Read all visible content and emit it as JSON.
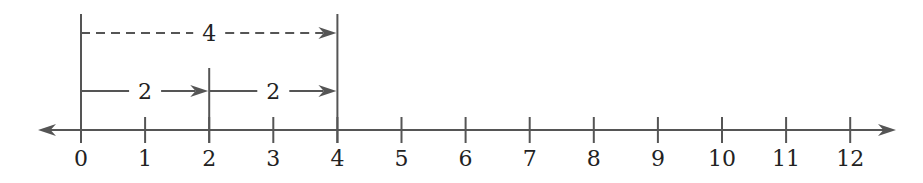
{
  "diagram": {
    "type": "number-line",
    "title": "",
    "axis": {
      "min": 0,
      "max": 12,
      "ticks": [
        "0",
        "1",
        "2",
        "3",
        "4",
        "5",
        "6",
        "7",
        "8",
        "9",
        "10",
        "11",
        "12"
      ],
      "arrows": [
        "left",
        "right"
      ]
    },
    "jumps": [
      {
        "from": 0,
        "to": 2,
        "label": "2",
        "style": "solid"
      },
      {
        "from": 2,
        "to": 4,
        "label": "2",
        "style": "solid"
      },
      {
        "from": 0,
        "to": 4,
        "label": "4",
        "style": "dashed"
      }
    ],
    "colors": {
      "line": "#555555",
      "text": "#222222",
      "background": "#ffffff"
    }
  }
}
